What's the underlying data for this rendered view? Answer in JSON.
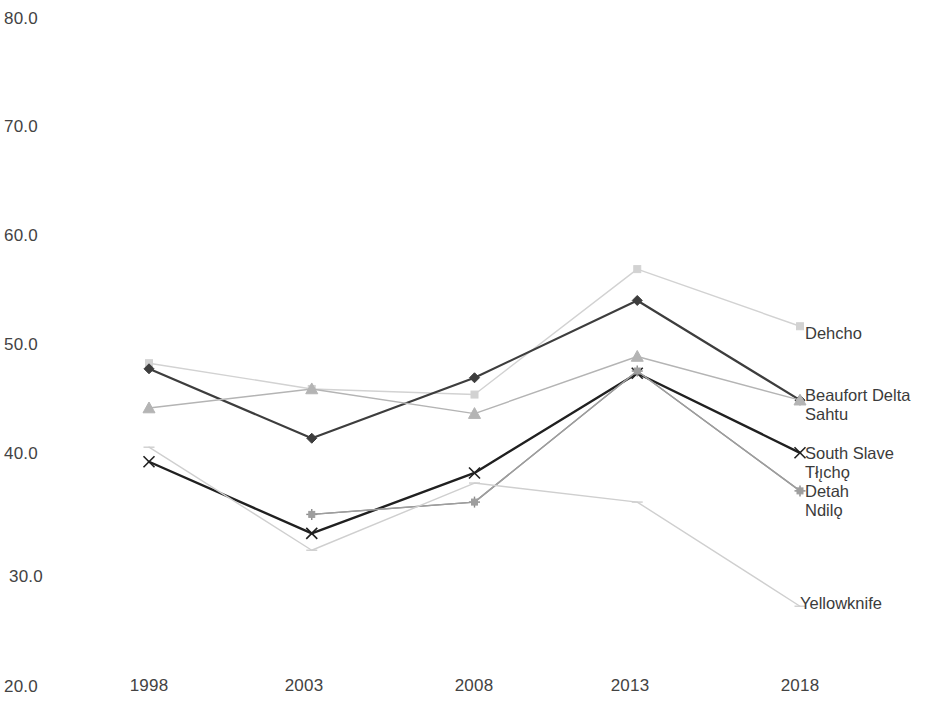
{
  "chart_data": {
    "type": "line",
    "title": "",
    "subtitle": "",
    "xlabel": "",
    "ylabel": "",
    "x": [
      1998,
      2003,
      2008,
      2013,
      2018
    ],
    "categories": [
      "1998",
      "2003",
      "2008",
      "2013",
      "2018"
    ],
    "ylim": [
      20.0,
      80.0
    ],
    "yticks": [
      20.0,
      30.0,
      40.0,
      50.0,
      60.0,
      70.0,
      80.0
    ],
    "ytick_labels": [
      "20.0",
      "30.0",
      "40.0",
      "50.0",
      "60.0",
      "70.0",
      "80.0"
    ],
    "xtick_labels": [
      "1998",
      "2003",
      "2008",
      "2013",
      "2018"
    ],
    "grid": false,
    "legend_position": "right-inline-labels",
    "series": [
      {
        "name": "Dehcho",
        "label": "Dehcho",
        "color": "#d2d2d2",
        "marker": "square",
        "values": [
          49.0,
          46.7,
          46.2,
          57.4,
          52.3
        ]
      },
      {
        "name": "Beaufort Delta",
        "label": "Beaufort Delta",
        "color": "#3d3d3d",
        "marker": "diamond",
        "values": [
          48.5,
          42.3,
          47.7,
          54.6,
          45.7
        ]
      },
      {
        "name": "Sahtu",
        "label": "Sahtu",
        "color": "#b4b4b4",
        "marker": "triangle",
        "values": [
          45.0,
          46.7,
          44.5,
          49.6,
          45.7
        ]
      },
      {
        "name": "South Slave",
        "label": "South Slave",
        "color": "#202020",
        "marker": "x",
        "values": [
          40.2,
          33.8,
          39.2,
          48.1,
          41.0
        ]
      },
      {
        "name": "Tlicho",
        "label": "Tłı̨chǫ",
        "color": "#8a8a8a",
        "marker": "plus",
        "values": [
          null,
          35.5,
          36.6,
          48.3,
          37.6
        ]
      },
      {
        "name": "Detah Ndilo",
        "label_line1": "Detah",
        "label_line2": "Ndilǫ",
        "color": "#9e9e9e",
        "marker": "square-small",
        "values": [
          null,
          35.5,
          36.6,
          48.3,
          37.6
        ]
      },
      {
        "name": "Yellowknife",
        "label": "Yellowknife",
        "color": "#cfcfcf",
        "marker": "dash",
        "values": [
          41.5,
          32.3,
          38.3,
          36.6,
          27.3
        ]
      }
    ],
    "inline_labels": [
      {
        "text": "Dehcho",
        "series": "Dehcho"
      },
      {
        "text": "Beaufort Delta",
        "series": "Beaufort Delta"
      },
      {
        "text": "Sahtu",
        "series": "Sahtu"
      },
      {
        "text": "South Slave",
        "series": "South Slave"
      },
      {
        "text": "Tłı̨chǫ",
        "series": "Tlicho"
      },
      {
        "text": "Detah",
        "series": "Detah Ndilo"
      },
      {
        "text": "Ndilǫ",
        "series": "Detah Ndilo"
      },
      {
        "text": "Yellowknife",
        "series": "Yellowknife"
      }
    ]
  },
  "axis": {
    "y": {
      "t80": "80.0",
      "t70": "70.0",
      "t60": "60.0",
      "t50": "50.0",
      "t40": "40.0",
      "t30": "30.0",
      "t20": "20.0"
    },
    "x": {
      "t1998": "1998",
      "t2003": "2003",
      "t2008": "2008",
      "t2013": "2013",
      "t2018": "2018"
    }
  },
  "labels": {
    "dehcho": "Dehcho",
    "beaufort_delta": "Beaufort Delta",
    "sahtu": "Sahtu",
    "south_slave": "South Slave",
    "tlicho": "Tłı̨chǫ",
    "detah": "Detah",
    "ndilo": "Ndilǫ",
    "yellowknife": "Yellowknife"
  },
  "colors": {
    "dehcho": "#d2d2d2",
    "beaufort_delta": "#3d3d3d",
    "sahtu": "#b4b4b4",
    "south_slave": "#202020",
    "tlicho": "#8a8a8a",
    "detah_ndilo": "#9e9e9e",
    "yellowknife": "#cfcfcf",
    "text": "#3b3b3b"
  }
}
